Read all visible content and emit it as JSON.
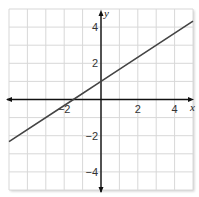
{
  "chart_data": {
    "type": "line",
    "title": "",
    "xlabel": "x",
    "ylabel": "y",
    "xlim": [
      -5,
      5
    ],
    "ylim": [
      -5,
      5
    ],
    "grid": true,
    "x_ticks": [
      -2,
      2,
      4
    ],
    "y_ticks": [
      4,
      2,
      -2,
      -4
    ],
    "x_tick_labels": [
      "−2",
      "2",
      "4"
    ],
    "y_tick_labels": [
      "4",
      "2",
      "−2",
      "−4"
    ],
    "series": [
      {
        "name": "line",
        "equation": "y = (2/3)x + 1",
        "x": [
          -5,
          -1.5,
          0,
          5
        ],
        "y": [
          -2.33,
          0,
          1,
          4.33
        ]
      }
    ],
    "colors": {
      "line": "#444444",
      "grid": "#d8d8d8",
      "axis": "#111111"
    }
  }
}
